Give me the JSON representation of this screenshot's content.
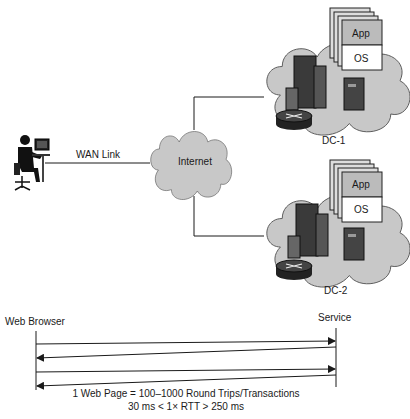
{
  "labels": {
    "wan_link": "WAN Link",
    "internet": "Internet",
    "dc1": "DC-1",
    "dc2": "DC-2",
    "app": "App",
    "os": "OS",
    "web_browser": "Web Browser",
    "service": "Service",
    "caption_line1": "1 Web Page = 100–1000 Round Trips/Transactions",
    "caption_line2": "30 ms < 1× RTT > 250 ms"
  },
  "icons": {
    "user": "user-at-computer-icon",
    "cloud": "cloud-icon",
    "building": "building-icon",
    "router": "router-icon",
    "server": "server-icon",
    "vm_stack": "virtual-machine-stack-icon"
  },
  "colors": {
    "cloud_fill": "#c8c8c8",
    "line": "#1a1a1a",
    "dark": "#2a2a2a"
  }
}
